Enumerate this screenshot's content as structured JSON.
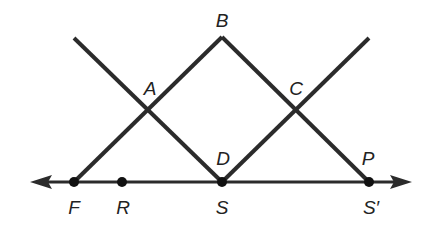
{
  "diagram": {
    "title": "",
    "width": 422,
    "height": 227,
    "line_color": "#2b2b2b",
    "point_color": "#111111",
    "baseline": {
      "y": 182,
      "x_start": 30,
      "x_end": 412,
      "arrows": "both"
    },
    "segments": [
      {
        "name": "F-B",
        "from": [
          74,
          182
        ],
        "to": [
          222,
          37
        ]
      },
      {
        "name": "B-S-prime",
        "from": [
          222,
          37
        ],
        "to": [
          369,
          182
        ]
      },
      {
        "name": "upper-left-to-S",
        "from": [
          74,
          38
        ],
        "to": [
          222,
          182
        ]
      },
      {
        "name": "S-to-upper-right",
        "from": [
          222,
          182
        ],
        "to": [
          369,
          38
        ]
      }
    ],
    "points": [
      {
        "id": "F",
        "x": 74,
        "y": 182
      },
      {
        "id": "R",
        "x": 122,
        "y": 182
      },
      {
        "id": "S",
        "x": 222,
        "y": 182
      },
      {
        "id": "S_prime",
        "x": 369,
        "y": 182
      }
    ],
    "labels": {
      "A": "A",
      "B": "B",
      "C": "C",
      "D": "D",
      "P": "P",
      "F": "F",
      "R": "R",
      "S": "S",
      "S_prime": "S′"
    }
  }
}
